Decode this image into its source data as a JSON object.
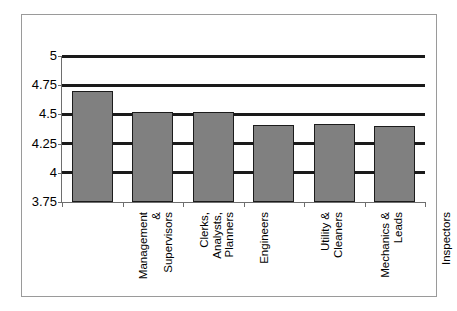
{
  "chart_data": {
    "type": "bar",
    "title": "",
    "subtitle": "",
    "xlabel": "",
    "ylabel": "",
    "categories": [
      "Management\n&\nSupervisors",
      "Clerks,\nAnalysts,\nPlanners",
      "Engineers",
      "Utility &\nCleaners",
      "Mechanics &\nLeads",
      "Inspectors"
    ],
    "values": [
      4.7,
      4.52,
      4.52,
      4.41,
      4.42,
      4.4
    ],
    "ylim": [
      3.75,
      5
    ],
    "yticks": [
      3.75,
      4,
      4.25,
      4.5,
      4.75,
      5
    ],
    "ytick_labels": [
      "3.75",
      "4",
      "4.25",
      "4.5",
      "4.75",
      "5"
    ],
    "grid": true,
    "legend": false,
    "legend_position": "none",
    "bar_color": "#808080",
    "bar_edge_color": "#1c1c1c",
    "gridline_color": "#1a1a1a",
    "axis_color": "#6e6e6e",
    "frame_color": "#9a9a9a",
    "background_color": "#ffffff"
  }
}
